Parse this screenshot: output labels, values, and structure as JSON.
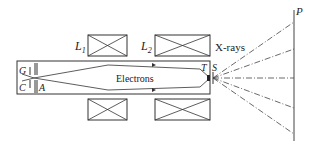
{
  "diagram": {
    "labels": {
      "lens1": "L",
      "lens1_sub": "1",
      "lens2": "L",
      "lens2_sub": "2",
      "xrays": "X-rays",
      "electrons": "Electrons",
      "grid": "G",
      "cathode": "C",
      "anode": "A",
      "target": "T",
      "source": "S",
      "plate": "P"
    },
    "colors": {
      "line": "#333333",
      "background": "#ffffff"
    }
  }
}
